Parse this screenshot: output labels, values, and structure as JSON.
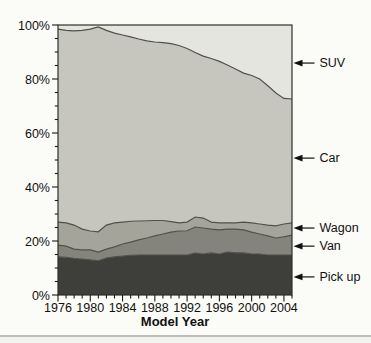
{
  "page": {
    "background": "#fbfbf7"
  },
  "chart_data": {
    "type": "area",
    "stacked": true,
    "title": "",
    "xlabel": "Model Year",
    "ylabel": "",
    "grid": false,
    "legend_position": "right-annotations",
    "xlim": [
      1976,
      2005
    ],
    "ylim": [
      0,
      100
    ],
    "x": [
      1976,
      1977,
      1978,
      1979,
      1980,
      1981,
      1982,
      1983,
      1984,
      1985,
      1986,
      1987,
      1988,
      1989,
      1990,
      1991,
      1992,
      1993,
      1994,
      1995,
      1996,
      1997,
      1998,
      1999,
      2000,
      2001,
      2002,
      2003,
      2004,
      2005
    ],
    "series": [
      {
        "name": "Pick up",
        "color": "#3e3e3a",
        "values": [
          14.1,
          14.0,
          13.6,
          13.3,
          13.0,
          12.7,
          13.7,
          14.1,
          14.4,
          14.7,
          14.8,
          14.8,
          14.8,
          14.8,
          14.8,
          14.8,
          14.8,
          15.5,
          15.2,
          15.6,
          15.2,
          15.9,
          15.6,
          15.6,
          15.2,
          15.2,
          14.8,
          14.8,
          14.8,
          14.8
        ]
      },
      {
        "name": "Van",
        "color": "#84847c",
        "values": [
          4.4,
          4.1,
          3.4,
          3.4,
          3.7,
          3.2,
          3.3,
          3.7,
          4.5,
          4.9,
          5.6,
          6.3,
          7.1,
          7.8,
          8.5,
          8.9,
          9.0,
          9.7,
          9.6,
          8.8,
          8.9,
          8.5,
          8.8,
          8.5,
          8.1,
          7.4,
          7.1,
          6.3,
          6.7,
          7.4
        ]
      },
      {
        "name": "Wagon",
        "color": "#a4a49b",
        "values": [
          8.5,
          8.6,
          8.9,
          7.7,
          7.0,
          7.5,
          8.9,
          8.9,
          8.1,
          7.7,
          7.0,
          6.4,
          5.7,
          5.0,
          3.9,
          3.0,
          3.2,
          3.7,
          3.7,
          2.6,
          2.6,
          2.3,
          2.3,
          2.9,
          3.4,
          3.7,
          4.0,
          4.5,
          4.8,
          4.5
        ]
      },
      {
        "name": "Car",
        "color": "#c6c6bf",
        "values": [
          71.5,
          71.3,
          71.9,
          73.6,
          74.8,
          75.9,
          72.1,
          70.3,
          69.3,
          68.3,
          67.4,
          66.6,
          66.1,
          65.9,
          65.9,
          65.7,
          64.3,
          60.9,
          60.0,
          60.6,
          59.8,
          58.5,
          57.0,
          55.2,
          54.6,
          53.7,
          51.6,
          49.2,
          46.5,
          45.9
        ]
      },
      {
        "name": "SUV",
        "color": "#e5e5df",
        "values": [
          1.5,
          2.0,
          2.2,
          2.0,
          1.5,
          0.7,
          2.0,
          3.0,
          3.7,
          4.4,
          5.2,
          5.9,
          6.3,
          6.5,
          6.9,
          7.6,
          8.7,
          10.2,
          11.5,
          12.4,
          13.5,
          14.8,
          16.3,
          17.8,
          18.7,
          20.0,
          22.5,
          25.2,
          27.2,
          27.4
        ]
      }
    ],
    "y_tick_values": [
      0,
      20,
      40,
      60,
      80,
      100
    ],
    "y_tick_labels": [
      "0%",
      "20%",
      "40%",
      "60%",
      "80%",
      "100%"
    ],
    "y_minor_step": 5,
    "x_tick_years": [
      1976,
      1980,
      1984,
      1988,
      1992,
      1996,
      2000,
      2004
    ],
    "x_tick_labels": [
      "1976",
      "1980",
      "1984",
      "1988",
      "1992",
      "1996",
      "2000",
      "2004"
    ],
    "x_minor_step": 1,
    "boundary_line_color": "#50504a",
    "frame_color": "#30302c",
    "tick_color": "#1a1a1a",
    "text_color": "#111111"
  },
  "annotations": [
    {
      "label": "SUV",
      "value_percent": 85.9
    },
    {
      "label": "Car",
      "value_percent": 50.7
    },
    {
      "label": "Wagon",
      "value_percent": 24.8
    },
    {
      "label": "Van",
      "value_percent": 18.1
    },
    {
      "label": "Pick up",
      "value_percent": 6.7
    }
  ],
  "annotation_arrow_color": "#111111"
}
